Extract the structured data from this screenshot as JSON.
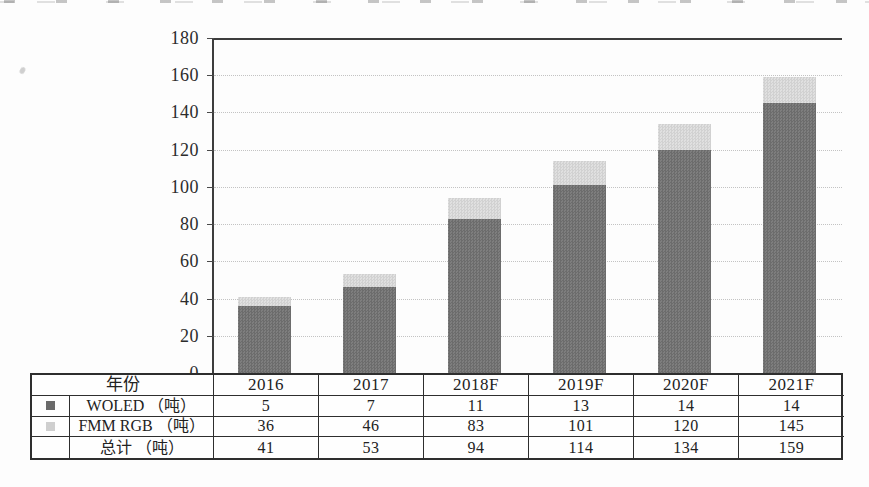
{
  "chart_data": {
    "type": "bar",
    "stacked": true,
    "title": "",
    "xlabel": "",
    "ylabel": "",
    "categories": [
      "2016",
      "2017",
      "2018F",
      "2019F",
      "2020F",
      "2021F"
    ],
    "series": [
      {
        "name": "FMM RGB（吨）",
        "segment": "bottom",
        "color": "#757575",
        "values": [
          36,
          46,
          83,
          101,
          120,
          145
        ]
      },
      {
        "name": "WOLED（吨）",
        "segment": "top",
        "color": "#d8d8d8",
        "values": [
          5,
          7,
          11,
          13,
          14,
          14
        ]
      }
    ],
    "totals": [
      41,
      53,
      94,
      114,
      134,
      159
    ],
    "ylim": [
      0,
      180
    ],
    "yticks": [
      0,
      20,
      40,
      60,
      80,
      100,
      120,
      140,
      160,
      180
    ],
    "grid": true,
    "legend_position": "in-table-left-column"
  },
  "table": {
    "corner_label": "年份",
    "col_headers": [
      "2016",
      "2017",
      "2018F",
      "2019F",
      "2020F",
      "2021F"
    ],
    "rows": [
      {
        "swatch_color": "#6a6a6a",
        "label": "WOLED （吨）",
        "values": [
          "5",
          "7",
          "11",
          "13",
          "14",
          "14"
        ]
      },
      {
        "swatch_color": "#cfcfcf",
        "label": "FMM RGB （吨）",
        "values": [
          "36",
          "46",
          "83",
          "101",
          "120",
          "145"
        ]
      },
      {
        "swatch_color": null,
        "label": "总计 （吨）",
        "values": [
          "41",
          "53",
          "94",
          "114",
          "134",
          "159"
        ]
      }
    ]
  },
  "colors": {
    "bar_dark": "#757575",
    "bar_light": "#d8d8d8",
    "gridline": "#c3c3c3",
    "axis": "#3d3d3d",
    "table_border": "#2e2e2e",
    "text": "#222222",
    "background": "#fdfdfd"
  }
}
